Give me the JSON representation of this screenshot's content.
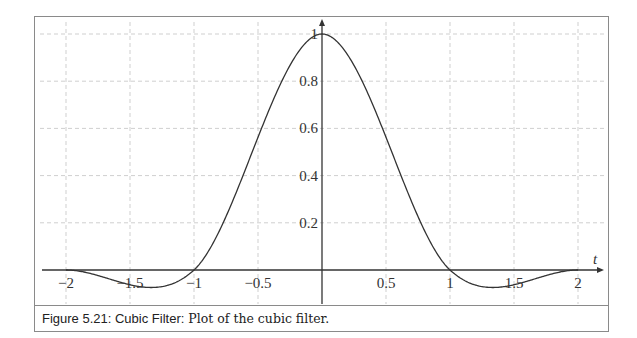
{
  "figure": {
    "caption_label": "Figure 5.21: Cubic Filter",
    "caption_sep": ":",
    "caption_text": " Plot of the cubic filter."
  },
  "chart_data": {
    "type": "line",
    "title": "",
    "xlabel": "t",
    "ylabel": "",
    "xlim": [
      -2.1,
      2.15
    ],
    "ylim": [
      -0.1,
      1.05
    ],
    "grid": true,
    "x_ticks": [
      -2,
      -1.5,
      -1,
      -0.5,
      0.5,
      1,
      1.5,
      2
    ],
    "x_tick_labels": [
      "−2",
      "−1.5",
      "−1",
      "−0.5",
      "0.5",
      "1",
      "1.5",
      "2"
    ],
    "y_ticks": [
      0.2,
      0.4,
      0.6,
      0.8,
      1
    ],
    "y_tick_labels": [
      "0.2",
      "0.4",
      "0.6",
      "0.8",
      "1"
    ],
    "series": [
      {
        "name": "cubic filter",
        "function": "Catmull-Rom cubic (a = -0.5)",
        "x": [
          -2,
          -1.5,
          -1.333,
          -1,
          -0.5,
          0,
          0.5,
          1,
          1.333,
          1.5,
          2
        ],
        "values": [
          0,
          -0.0625,
          -0.074,
          0,
          0.5625,
          1,
          0.5625,
          0,
          -0.074,
          -0.0625,
          0
        ]
      }
    ]
  }
}
